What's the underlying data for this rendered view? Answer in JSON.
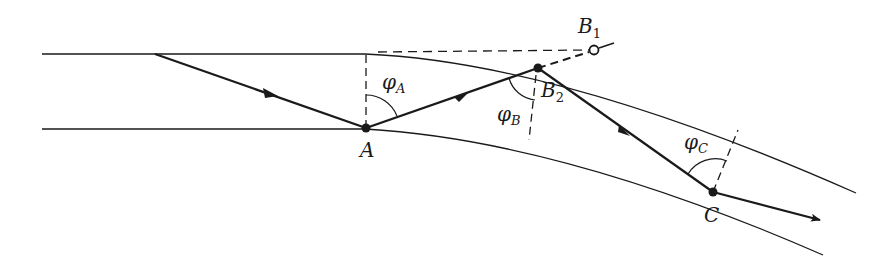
{
  "figure": {
    "colors": {
      "line": "#1a1a1a",
      "background": "#ffffff"
    },
    "labels": {
      "A": "A",
      "B1_main": "B",
      "B1_sub": "1",
      "B2_main": "B",
      "B2_sub": "2",
      "C": "C",
      "phiA_main": "φ",
      "phiA_sub": "A",
      "phiB_main": "φ",
      "phiB_sub": "B",
      "phiC_main": "φ",
      "phiC_sub": "C"
    },
    "points": {
      "ray_start": [
        155,
        54
      ],
      "A": [
        366,
        128
      ],
      "B1": [
        594,
        50
      ],
      "B2": [
        538,
        68
      ],
      "C": [
        713,
        192
      ],
      "ray_end": [
        820,
        220
      ]
    },
    "boundaries": [
      {
        "name": "upper-boundary",
        "straight_to_x": 365,
        "y": 54,
        "end": [
          856,
          193
        ]
      },
      {
        "name": "lower-boundary",
        "straight_to_x": 365,
        "y": 129,
        "end": [
          823,
          255
        ]
      }
    ],
    "angles": [
      "φA",
      "φB",
      "φC"
    ]
  }
}
